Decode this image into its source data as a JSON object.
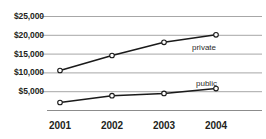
{
  "chart_data": {
    "type": "line",
    "title": "",
    "xlabel": "",
    "ylabel": "",
    "categories": [
      "2001",
      "2002",
      "2003",
      "2004"
    ],
    "ylim": [
      0,
      25000
    ],
    "ytick_values": [
      25000,
      20000,
      15000,
      10000,
      5000
    ],
    "ytick_labels": [
      "$25,000",
      "$20,000",
      "$15,000",
      "$10,000",
      "$5,000"
    ],
    "grid": true,
    "legend_position": "inline-right",
    "series": [
      {
        "name": "private",
        "values": [
          10500,
          14500,
          18000,
          20000
        ],
        "marker": "open-circle",
        "color": "#1a1a1a"
      },
      {
        "name": "public",
        "values": [
          2000,
          3800,
          4400,
          5700
        ],
        "marker": "open-circle",
        "color": "#1a1a1a"
      }
    ],
    "annotations": [
      {
        "text": "private",
        "series": "private"
      },
      {
        "text": "public",
        "series": "public"
      }
    ]
  },
  "axes": {
    "gridline_color": "#a7a7a7",
    "baseline_color": "#8c8c8c",
    "label_color": "#231f20"
  }
}
